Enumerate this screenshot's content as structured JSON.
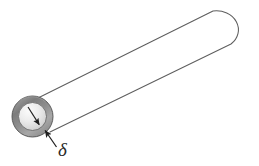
{
  "figure": {
    "name": "hollow-cylinder-wall-thickness-diagram",
    "background_color": "#ffffff",
    "outline_color": "#595959",
    "annotation_color": "#2b2b2b"
  },
  "labels": {
    "delta": "δ"
  },
  "geometry": {
    "canvas": {
      "width": 259,
      "height": 166
    },
    "annulus": {
      "center_x": 32.5,
      "center_y": 116.5,
      "outer_radius": 20.5,
      "inner_radius": 14.0,
      "shell_color_light": "#bdbdbd",
      "shell_color_dark": "#6f6f6f",
      "bore_color_light": "#f2f2f2",
      "bore_color_dark": "#c9c9c9",
      "edge_color": "#4a4a4a"
    },
    "body": {
      "top_tangent_start_x": 38,
      "top_tangent_start_y": 98,
      "top_tangent_end_x": 219,
      "top_tangent_end_y": 9,
      "bottom_tangent_start_x": 50,
      "bottom_tangent_start_y": 132,
      "bottom_tangent_end_x": 231,
      "bottom_tangent_end_y": 44,
      "cap_center_x": 225,
      "cap_center_y": 26,
      "cap_radius_x": 22,
      "cap_radius_y": 19
    },
    "delta_arrow": {
      "tail_x": 57,
      "tail_y": 147,
      "head_x": 44,
      "head_y": 129
    },
    "bore_arrow": {
      "tail_x": 28,
      "tail_y": 108,
      "head_x": 40,
      "head_y": 126
    },
    "delta_label": {
      "x": 58,
      "y": 155
    }
  }
}
